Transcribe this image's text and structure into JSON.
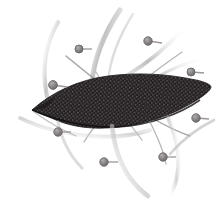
{
  "figure": {
    "title": "Textured dark leaf-shaped pod with radiating pin markers",
    "width": 220,
    "height": 202,
    "background_color": "#ffffff",
    "style": "grayscale botanical-style line illustration"
  },
  "palette": {
    "background": "#ffffff",
    "body_dark": "#231f20",
    "body_dark_edge": "#3a3537",
    "texture_light": "#6d6668",
    "swirl_gray_dark": "#8e8b8c",
    "swirl_gray_mid": "#b4b1b2",
    "swirl_gray_light": "#d8d6d7",
    "pin_head": "#8a8688",
    "pin_head_ring": "#6b6769",
    "pin_stem": "#9b9799"
  },
  "central_shape": {
    "name": "leaf-pod-body",
    "description": "elongated dark pointed pod/leaf form, tip at left, tapering to right",
    "fill": "#231f20",
    "texture": "fine woven crosshatch mesh of tiny light flecks",
    "bounds": {
      "x": 30,
      "y": 74,
      "width": 182,
      "height": 54
    }
  },
  "swirls": [
    {
      "name": "swirl-upper-left",
      "shade": "#c9c6c7"
    },
    {
      "name": "swirl-top-center",
      "shade": "#b0adae"
    },
    {
      "name": "swirl-top-right",
      "shade": "#c2bfc0"
    },
    {
      "name": "swirl-right-arc",
      "shade": "#9d999b"
    },
    {
      "name": "swirl-lower-left",
      "shade": "#c6c3c4"
    },
    {
      "name": "swirl-lower-center",
      "shade": "#b8b5b6"
    },
    {
      "name": "swirl-lower-right",
      "shade": "#aeabac"
    },
    {
      "name": "swirl-long-diagonal",
      "shade": "#8e8b8c"
    },
    {
      "name": "swirl-thin-cross",
      "shade": "#a5a1a3"
    }
  ],
  "pins": [
    {
      "id": 1,
      "name": "pin-top-left",
      "cx": 79,
      "cy": 49,
      "r": 4.0,
      "stem_dx": 13,
      "stem_dy": 0
    },
    {
      "id": 2,
      "name": "pin-top-right",
      "cx": 148,
      "cy": 41,
      "r": 4.2,
      "stem_dx": 14,
      "stem_dy": 2
    },
    {
      "id": 3,
      "name": "pin-left-upper",
      "cx": 53,
      "cy": 85,
      "r": 4.4,
      "stem_dx": 14,
      "stem_dy": 2
    },
    {
      "id": 4,
      "name": "pin-right-upper",
      "cx": 191,
      "cy": 72,
      "r": 4.0,
      "stem_dx": 13,
      "stem_dy": 1
    },
    {
      "id": 5,
      "name": "pin-left-lower",
      "cx": 58,
      "cy": 132,
      "r": 4.2,
      "stem_dx": 13,
      "stem_dy": 0
    },
    {
      "id": 6,
      "name": "pin-right-lower",
      "cx": 196,
      "cy": 118,
      "r": 4.2,
      "stem_dx": 13,
      "stem_dy": 1
    },
    {
      "id": 7,
      "name": "pin-bottom-left",
      "cx": 104,
      "cy": 162,
      "r": 4.2,
      "stem_dx": 14,
      "stem_dy": 0
    },
    {
      "id": 8,
      "name": "pin-bottom-right",
      "cx": 163,
      "cy": 157,
      "r": 4.2,
      "stem_dx": 13,
      "stem_dy": 0
    }
  ]
}
